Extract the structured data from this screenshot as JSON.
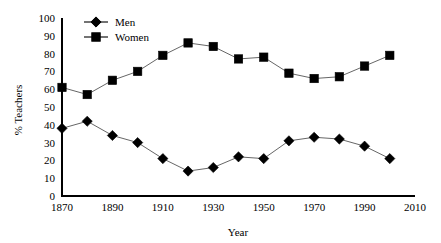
{
  "chart_data": {
    "type": "line",
    "title": "",
    "xlabel": "Year",
    "ylabel": "% Teachers",
    "x": [
      1870,
      1880,
      1890,
      1900,
      1910,
      1920,
      1930,
      1940,
      1950,
      1960,
      1970,
      1980,
      1990,
      2000
    ],
    "xlim": [
      1870,
      2010
    ],
    "ylim": [
      0,
      100
    ],
    "xticks": [
      1870,
      1890,
      1910,
      1930,
      1950,
      1970,
      1990,
      2010
    ],
    "xtick_labels": [
      "1870",
      "1890",
      "1910",
      "1930",
      "1950",
      "1970",
      "1990",
      "2010"
    ],
    "yticks": [
      0,
      10,
      20,
      30,
      40,
      50,
      60,
      70,
      80,
      90,
      100
    ],
    "ytick_labels": [
      "0",
      "10",
      "20",
      "30",
      "40",
      "50",
      "60",
      "70",
      "80",
      "90",
      "100"
    ],
    "grid": false,
    "legend_position": "top-left-inside",
    "series": [
      {
        "name": "Men",
        "marker": "diamond",
        "color": "#000000",
        "values": [
          38,
          42,
          34,
          30,
          21,
          14,
          16,
          22,
          21,
          31,
          33,
          32,
          28,
          21
        ]
      },
      {
        "name": "Women",
        "marker": "square",
        "color": "#000000",
        "values": [
          61,
          57,
          65,
          70,
          79,
          86,
          84,
          77,
          78,
          69,
          66,
          67,
          73,
          79
        ]
      }
    ]
  },
  "legend": {
    "entries": [
      {
        "label": "Men",
        "marker": "diamond"
      },
      {
        "label": "Women",
        "marker": "square"
      }
    ]
  },
  "axes": {
    "x_title": "Year",
    "y_title": "% Teachers"
  }
}
